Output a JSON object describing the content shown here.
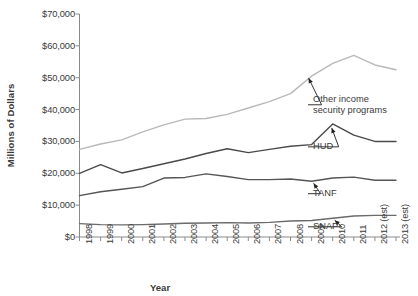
{
  "chart_data": {
    "type": "line",
    "title": "",
    "xlabel": "Year",
    "ylabel": "Millions of Dollars",
    "ylim": [
      0,
      70000
    ],
    "ytick_labels": [
      "$70,000",
      "$60,000",
      "$50,000",
      "$40,000",
      "$30,000",
      "$20,000",
      "$10,000",
      "$0"
    ],
    "ytick_values": [
      70000,
      60000,
      50000,
      40000,
      30000,
      20000,
      10000,
      0
    ],
    "grid": false,
    "legend_position": "inline-annotations",
    "categories": [
      "1998",
      "1999",
      "2000",
      "2001",
      "2002",
      "2003",
      "2004",
      "2005",
      "2006",
      "2007",
      "2008",
      "2009",
      "2010",
      "2011",
      "2012 (est)",
      "2013 (est)"
    ],
    "series": [
      {
        "name": "Other income security programs",
        "color": "#b9b9b9",
        "values": [
          27500,
          29200,
          30500,
          33000,
          35200,
          37000,
          37200,
          38500,
          40500,
          42500,
          45000,
          50500,
          54500,
          57000,
          54000,
          52500
        ]
      },
      {
        "name": "HUD",
        "color": "#4a4a4a",
        "values": [
          20000,
          22700,
          20100,
          21500,
          23000,
          24500,
          26200,
          27700,
          26500,
          27500,
          28500,
          29000,
          35500,
          32000,
          30000,
          30000
        ]
      },
      {
        "name": "TANF",
        "color": "#555555",
        "values": [
          13000,
          14200,
          15000,
          15800,
          18500,
          18700,
          19800,
          19000,
          18000,
          18000,
          18200,
          17500,
          18500,
          18800,
          17800,
          17800
        ]
      },
      {
        "name": "SNAP",
        "color": "#6b6b6b",
        "values": [
          4200,
          3900,
          3800,
          3900,
          4100,
          4300,
          4400,
          4500,
          4400,
          4600,
          5000,
          5200,
          5900,
          6600,
          6800,
          6800
        ]
      }
    ],
    "annotations": [
      {
        "id": "other-income-annotation",
        "label_line1": "Other income",
        "label_line2": "security programs",
        "points_to": "Other income security programs"
      },
      {
        "id": "hud-annotation",
        "label_line1": "HUD",
        "label_line2": "",
        "points_to": "HUD"
      },
      {
        "id": "tanf-annotation",
        "label_line1": "TANF",
        "label_line2": "",
        "points_to": "TANF"
      },
      {
        "id": "snap-annotation",
        "label_line1": "SNAP",
        "label_line2": "",
        "points_to": "SNAP"
      }
    ]
  }
}
